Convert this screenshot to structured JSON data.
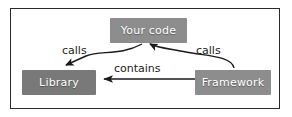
{
  "diagram": {
    "background_color": "#ffffff",
    "border_color": "#2b2b2b",
    "nodes": [
      {
        "id": "your-code",
        "label": "Your code",
        "color": "#8d8d8d",
        "text_color": "#ffffff"
      },
      {
        "id": "library",
        "label": "Library",
        "color": "#797979",
        "text_color": "#ffffff"
      },
      {
        "id": "framework",
        "label": "Framework",
        "color": "#8d8d8d",
        "text_color": "#ffffff"
      }
    ],
    "edges": [
      {
        "id": "your-code-to-library",
        "label": "calls",
        "from": "your-code",
        "to": "library",
        "style": "curved",
        "arrow_color": "#1b1b1b"
      },
      {
        "id": "framework-to-your-code",
        "label": "calls",
        "from": "framework",
        "to": "your-code",
        "style": "curved",
        "arrow_color": "#1b1b1b"
      },
      {
        "id": "framework-contains-library",
        "label": "contains",
        "from": "framework",
        "to": "library",
        "style": "straight",
        "arrow_color": "#1b1b1b"
      }
    ]
  }
}
